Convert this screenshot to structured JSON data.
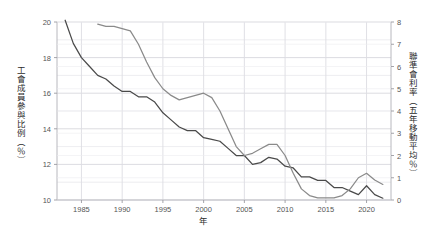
{
  "chart_data": {
    "type": "line",
    "title": "",
    "xlabel": "年",
    "ylabel": "工會成員參與比例（％）",
    "ylabel_right": "聯準會利率（五年移動平均％）",
    "xlim": [
      1982,
      2023
    ],
    "ylim": [
      10,
      20
    ],
    "ylim_right": [
      0,
      8
    ],
    "grid": true,
    "legend_position": "none",
    "xticks": [
      1985,
      1990,
      1995,
      2000,
      2005,
      2010,
      2015,
      2020
    ],
    "xtick_labels": [
      "1985",
      "1990",
      "1995",
      "2000",
      "2005",
      "2010",
      "2015",
      "2020"
    ],
    "yticks_left": [
      10,
      12,
      14,
      16,
      18,
      20
    ],
    "ytick_labels_left": [
      "10",
      "12",
      "14",
      "16",
      "18",
      "20"
    ],
    "yticks_left_minor": [
      11,
      13,
      15,
      17,
      19
    ],
    "yticks_right": [
      0,
      1,
      2,
      3,
      4,
      5,
      6,
      7,
      8
    ],
    "ytick_labels_right": [
      "0",
      "1",
      "2",
      "3",
      "4",
      "5",
      "6",
      "7",
      "8"
    ],
    "series": [
      {
        "name": "工會成員參與比例（％）",
        "axis": "left",
        "color": "#4a4a4a",
        "x": [
          1983,
          1984,
          1985,
          1986,
          1987,
          1988,
          1989,
          1990,
          1991,
          1992,
          1993,
          1994,
          1995,
          1996,
          1997,
          1998,
          1999,
          2000,
          2001,
          2002,
          2003,
          2004,
          2005,
          2006,
          2007,
          2008,
          2009,
          2010,
          2011,
          2012,
          2013,
          2014,
          2015,
          2016,
          2017,
          2018,
          2019,
          2020,
          2021,
          2022
        ],
        "values": [
          20.1,
          18.8,
          18.0,
          17.5,
          17.0,
          16.8,
          16.4,
          16.1,
          16.1,
          15.8,
          15.8,
          15.5,
          14.9,
          14.5,
          14.1,
          13.9,
          13.9,
          13.5,
          13.4,
          13.3,
          12.9,
          12.5,
          12.5,
          12.0,
          12.1,
          12.4,
          12.3,
          11.9,
          11.8,
          11.3,
          11.3,
          11.1,
          11.1,
          10.7,
          10.7,
          10.5,
          10.3,
          10.8,
          10.3,
          10.1
        ]
      },
      {
        "name": "聯準會利率（五年移動平均％）",
        "axis": "right",
        "color": "#8a8a8a",
        "x": [
          1987,
          1988,
          1989,
          1990,
          1991,
          1992,
          1993,
          1994,
          1995,
          1996,
          1997,
          1998,
          1999,
          2000,
          2001,
          2002,
          2003,
          2004,
          2005,
          2006,
          2007,
          2008,
          2009,
          2010,
          2011,
          2012,
          2013,
          2014,
          2015,
          2016,
          2017,
          2018,
          2019,
          2020,
          2021,
          2022
        ],
        "values": [
          7.9,
          7.8,
          7.8,
          7.7,
          7.6,
          7.0,
          6.2,
          5.5,
          5.0,
          4.7,
          4.5,
          4.6,
          4.7,
          4.8,
          4.6,
          4.0,
          3.2,
          2.4,
          2.0,
          2.1,
          2.3,
          2.5,
          2.5,
          2.0,
          1.2,
          0.5,
          0.2,
          0.1,
          0.1,
          0.1,
          0.2,
          0.5,
          1.0,
          1.2,
          0.9,
          0.7
        ]
      }
    ]
  }
}
